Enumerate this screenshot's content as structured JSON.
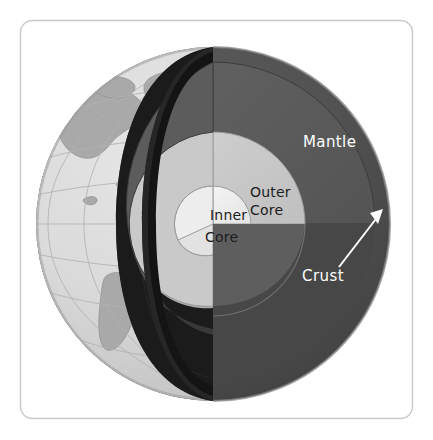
{
  "figure": {
    "border_color": "#c9c9c9",
    "background_color": "#ffffff"
  },
  "labels": {
    "mantle": "Mantle",
    "outer_core_line1": "Outer",
    "outer_core_line2": "Core",
    "inner_core_line1": "Inner",
    "inner_core_line2": "Core",
    "crust": "Crust"
  },
  "layers": [
    {
      "name": "crust",
      "label": "Crust",
      "surface_ocean_color": "#d9d9d9",
      "surface_land_color": "#a9a9a9",
      "graticule_color": "#b4b4b4",
      "edge_color": "#8f8f8f"
    },
    {
      "name": "mantle",
      "label": "Mantle",
      "outer_shell_color": "#4d4d4d",
      "cut_face_color": "#5a5a5a",
      "cut_face_shadow_color": "#4a4a4a",
      "inner_cavity_color": "#1b1b1b"
    },
    {
      "name": "outer-core",
      "label": "Outer Core",
      "cut_face_color": "#c7c7c7",
      "shell_color": "#b0b0b0"
    },
    {
      "name": "inner-core",
      "label": "Inner Core",
      "cut_face_color": "#efefef",
      "shell_color": "#d5d5d5"
    }
  ],
  "annotations": [
    {
      "name": "crust-pointer",
      "text": "Crust",
      "arrow_color": "#ffffff",
      "direction": "up-right"
    }
  ],
  "geometry": {
    "globe_center_x": 213,
    "globe_center_y": 224,
    "globe_radius": 177,
    "mantle_radius": 162,
    "outer_core_radius": 92,
    "inner_core_radius": 38
  }
}
